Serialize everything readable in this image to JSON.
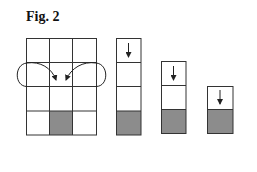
{
  "figure": {
    "title": "Fig. 2"
  },
  "colors": {
    "line": "#333333",
    "shaded_cell": "#8c8c8c",
    "background": "#ffffff"
  },
  "diagram": {
    "main_grid": {
      "columns": 3,
      "rows": 4,
      "shaded_cells": [
        {
          "row": 4,
          "col": 2
        }
      ],
      "arrows": [
        {
          "name": "left-curved-arrow",
          "from": "left edge between rows 2-3",
          "to": "center of row 2/3 boundary"
        },
        {
          "name": "right-curved-arrow",
          "from": "right edge between rows 2-3",
          "to": "center of row 2/3 boundary"
        }
      ]
    },
    "columns": [
      {
        "cells": 4,
        "shaded_cells": [
          4
        ],
        "arrow": "down arrow in top cell"
      },
      {
        "cells": 3,
        "shaded_cells": [
          3
        ],
        "arrow": "down arrow in top cell"
      },
      {
        "cells": 2,
        "shaded_cells": [
          2
        ],
        "arrow": "down arrow in top cell"
      }
    ]
  }
}
